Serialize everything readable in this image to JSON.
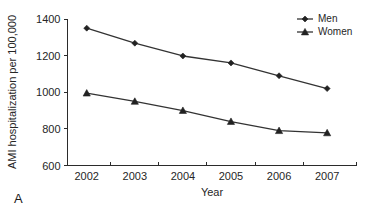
{
  "panel": {
    "label": "A"
  },
  "chart_data": {
    "type": "line",
    "title": "",
    "xlabel": "Year",
    "ylabel": "AMI hospitalization per 100,000",
    "categories": [
      "2002",
      "2003",
      "2004",
      "2005",
      "2006",
      "2007"
    ],
    "x": [
      2002,
      2003,
      2004,
      2005,
      2006,
      2007
    ],
    "xlim": [
      2001.6,
      2007.6
    ],
    "ylim": [
      600,
      1400
    ],
    "yticks": [
      600,
      800,
      1000,
      1200,
      1400
    ],
    "ytick_labels": [
      "600",
      "800",
      "1000",
      "1200",
      "1400"
    ],
    "xtick_labels": [
      "2002",
      "2003",
      "2004",
      "2005",
      "2006",
      "2007"
    ],
    "grid": false,
    "legend_position": "top-right",
    "series": [
      {
        "name": "Men",
        "marker": "diamond",
        "color": "#333333",
        "values": [
          1350,
          1268,
          1198,
          1160,
          1090,
          1020
        ]
      },
      {
        "name": "Women",
        "marker": "triangle",
        "color": "#333333",
        "values": [
          995,
          950,
          900,
          840,
          790,
          778
        ]
      }
    ]
  },
  "legend": {
    "items": [
      {
        "label": "Men",
        "marker": "diamond"
      },
      {
        "label": "Women",
        "marker": "triangle"
      }
    ]
  }
}
